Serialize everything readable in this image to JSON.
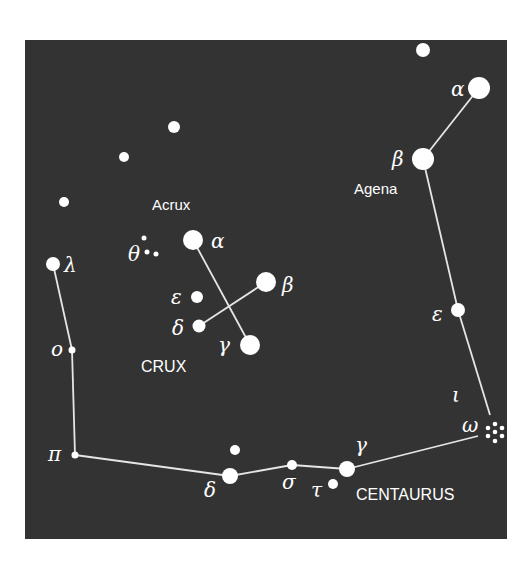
{
  "chart": {
    "background": "#333333",
    "panel": {
      "x": 25,
      "y": 40,
      "width": 482,
      "height": 499
    },
    "constellations": [
      {
        "name": "CRUX",
        "label_pos": [
          141,
          372
        ]
      },
      {
        "name": "CENTAURUS",
        "label_pos": [
          356,
          500
        ]
      }
    ],
    "star_names": [
      {
        "text": "Acrux",
        "pos": [
          152,
          210
        ]
      },
      {
        "text": "Agena",
        "pos": [
          354,
          194
        ]
      }
    ],
    "stars": [
      {
        "id": "cen-alpha",
        "greek": "α",
        "x": 479,
        "y": 88,
        "r": 11,
        "label_pos": [
          451,
          96
        ]
      },
      {
        "id": "cen-beta",
        "greek": "β",
        "x": 423,
        "y": 159,
        "r": 11,
        "label_pos": [
          392,
          166
        ]
      },
      {
        "id": "cen-epsilon",
        "greek": "ε",
        "x": 458,
        "y": 310,
        "r": 7,
        "label_pos": [
          432,
          321
        ]
      },
      {
        "id": "cen-iota",
        "greek": "ι",
        "x": null,
        "y": null,
        "r": 0,
        "label_pos": [
          452,
          402
        ]
      },
      {
        "id": "cen-omega",
        "greek": "ω",
        "x": 495,
        "y": 432,
        "r": 0,
        "label_pos": [
          462,
          432
        ],
        "cluster": true
      },
      {
        "id": "cen-gamma",
        "greek": "γ",
        "x": 347,
        "y": 469,
        "r": 8,
        "label_pos": [
          355,
          452
        ]
      },
      {
        "id": "cen-tau",
        "greek": "τ",
        "x": 333,
        "y": 484,
        "r": 5,
        "label_pos": [
          311,
          497
        ]
      },
      {
        "id": "cen-sigma",
        "greek": "σ",
        "x": 292,
        "y": 465,
        "r": 5,
        "label_pos": [
          282,
          489
        ]
      },
      {
        "id": "cen-delta",
        "greek": "δ",
        "x": 230,
        "y": 476,
        "r": 8,
        "label_pos": [
          204,
          497
        ]
      },
      {
        "id": "cen-delta-companion",
        "greek": "",
        "x": 235,
        "y": 450,
        "r": 5
      },
      {
        "id": "cen-pi",
        "greek": "π",
        "x": 75,
        "y": 455,
        "r": 3.5,
        "label_pos": [
          48,
          461
        ]
      },
      {
        "id": "cen-omicron",
        "greek": "ο",
        "x": 72,
        "y": 350,
        "r": 3.5,
        "label_pos": [
          51,
          356
        ]
      },
      {
        "id": "cen-lambda",
        "greek": "λ",
        "x": 53,
        "y": 264,
        "r": 7,
        "label_pos": [
          64,
          272
        ]
      },
      {
        "id": "cru-alpha",
        "greek": "α",
        "x": 193,
        "y": 240,
        "r": 10,
        "label_pos": [
          211,
          248
        ]
      },
      {
        "id": "cru-beta",
        "greek": "β",
        "x": 266,
        "y": 282,
        "r": 10,
        "label_pos": [
          282,
          292
        ]
      },
      {
        "id": "cru-gamma",
        "greek": "γ",
        "x": 250,
        "y": 345,
        "r": 10,
        "label_pos": [
          218,
          352
        ]
      },
      {
        "id": "cru-delta",
        "greek": "δ",
        "x": 199,
        "y": 326,
        "r": 6.5,
        "label_pos": [
          172,
          335
        ]
      },
      {
        "id": "cru-epsilon",
        "greek": "ε",
        "x": 197,
        "y": 297,
        "r": 6,
        "label_pos": [
          171,
          304
        ]
      },
      {
        "id": "cru-theta-1",
        "greek": "θ",
        "x": 144,
        "y": 238,
        "r": 2.5,
        "label_pos": [
          128,
          261
        ]
      },
      {
        "id": "cru-theta-2",
        "greek": "",
        "x": 147,
        "y": 252,
        "r": 2.5
      },
      {
        "id": "cru-theta-3",
        "greek": "",
        "x": 156,
        "y": 254,
        "r": 2.5
      },
      {
        "id": "field-1",
        "greek": "",
        "x": 423,
        "y": 50,
        "r": 7
      },
      {
        "id": "field-2",
        "greek": "",
        "x": 174,
        "y": 127,
        "r": 6
      },
      {
        "id": "field-3",
        "greek": "",
        "x": 124,
        "y": 157,
        "r": 5
      },
      {
        "id": "field-4",
        "greek": "",
        "x": 64,
        "y": 202,
        "r": 5
      }
    ],
    "lines": [
      [
        [
          479,
          88
        ],
        [
          423,
          159
        ]
      ],
      [
        [
          423,
          159
        ],
        [
          458,
          310
        ]
      ],
      [
        [
          458,
          310
        ],
        [
          490,
          415
        ]
      ],
      [
        [
          478,
          436
        ],
        [
          347,
          469
        ]
      ],
      [
        [
          347,
          469
        ],
        [
          292,
          465
        ]
      ],
      [
        [
          292,
          465
        ],
        [
          230,
          476
        ]
      ],
      [
        [
          230,
          476
        ],
        [
          75,
          455
        ]
      ],
      [
        [
          75,
          455
        ],
        [
          72,
          350
        ]
      ],
      [
        [
          72,
          350
        ],
        [
          53,
          264
        ]
      ],
      [
        [
          193,
          240
        ],
        [
          250,
          345
        ]
      ],
      [
        [
          266,
          282
        ],
        [
          199,
          326
        ]
      ]
    ]
  }
}
